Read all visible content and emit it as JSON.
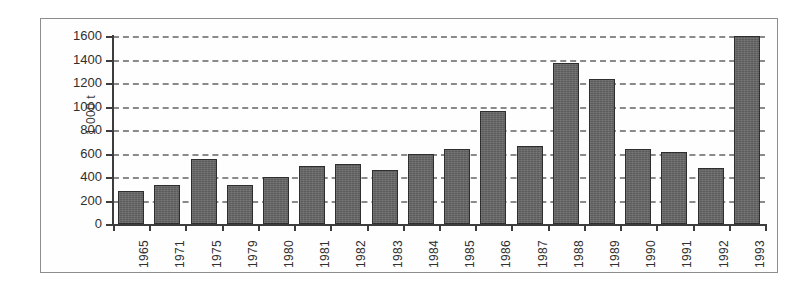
{
  "chart_data": {
    "type": "bar",
    "title": "",
    "subtitle": "",
    "xlabel": "",
    "ylabel": "1 000 t",
    "ylim": [
      0,
      1600
    ],
    "ytick_step": 200,
    "yticks": [
      0,
      200,
      400,
      600,
      800,
      1000,
      1200,
      1400,
      1600
    ],
    "ytick_labels": [
      "0",
      "200",
      "400",
      "600",
      "800",
      "1000",
      "1200",
      "1400",
      "1600"
    ],
    "grid": "horizontal-dashed",
    "legend": "none",
    "categories": [
      "1965",
      "1971",
      "1975",
      "1979",
      "1980",
      "1981",
      "1982",
      "1983",
      "1984",
      "1985",
      "1986",
      "1987",
      "1988",
      "1989",
      "1990",
      "1991",
      "1992",
      "1993"
    ],
    "values": [
      280,
      330,
      550,
      335,
      400,
      490,
      510,
      460,
      600,
      640,
      965,
      660,
      1370,
      1230,
      640,
      610,
      480,
      1600
    ],
    "bar_color": "#5c5c5c",
    "bar_edge_color": "#2e2e2e",
    "gridline_color": "#8a8a8a",
    "axis_color": "#3d3d3d",
    "background_color": "#fefefe",
    "frame_color": "#8d8d8d"
  }
}
